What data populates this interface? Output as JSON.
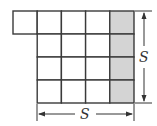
{
  "diagram": {
    "grid": {
      "origin_x": 13,
      "origin_y": 11,
      "cell_w": 24.2,
      "cell_h": 23,
      "rows": [
        {
          "start_col": 0,
          "end_col": 5
        },
        {
          "start_col": 1,
          "end_col": 5
        },
        {
          "start_col": 1,
          "end_col": 5
        },
        {
          "start_col": 1,
          "end_col": 5
        }
      ],
      "shaded_column": 4
    },
    "colors": {
      "line": "#3a3a3a",
      "shade": "#d4d4d4",
      "arrow": "#333333"
    },
    "dimensions": {
      "vertical_label": "S",
      "horizontal_label": "S"
    }
  }
}
